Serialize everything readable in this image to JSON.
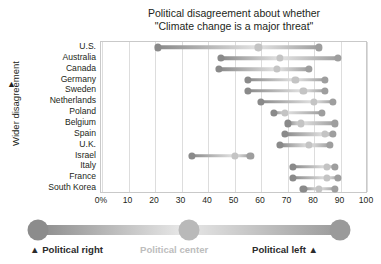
{
  "chart_data": {
    "type": "scatter",
    "title": "Political disagreement about whether \"Climate change is a major threat\"",
    "title_lines": [
      "Political disagreement about whether",
      "\"Climate change is a major threat\""
    ],
    "xlabel": "",
    "ylabel": "Wider disagreement",
    "ylabel_arrow": "▲",
    "xlim": [
      0,
      100
    ],
    "xticks": [
      0,
      10,
      20,
      30,
      40,
      50,
      60,
      70,
      80,
      90,
      100
    ],
    "xtick_labels": [
      "0%",
      "10",
      "20",
      "30",
      "40",
      "50",
      "60",
      "70",
      "80",
      "90",
      "100"
    ],
    "grid": true,
    "legend_position": "bottom",
    "series": [
      {
        "name": "Political right",
        "color": "#8c8c8c"
      },
      {
        "name": "Political center",
        "color": "#c2c2c2"
      },
      {
        "name": "Political left",
        "color": "#9a9a9a"
      }
    ],
    "categories": [
      "U.S.",
      "Australia",
      "Canada",
      "Germany",
      "Sweden",
      "Netherlands",
      "Poland",
      "Belgium",
      "Spain",
      "U.K.",
      "Israel",
      "Italy",
      "France",
      "South Korea"
    ],
    "rows": [
      {
        "country": "U.S.",
        "right": 21,
        "center": 59,
        "left": 82
      },
      {
        "country": "Australia",
        "right": 45,
        "center": 67,
        "left": 89
      },
      {
        "country": "Canada",
        "right": 44,
        "center": 66,
        "left": 78
      },
      {
        "country": "Germany",
        "right": 55,
        "center": 73,
        "left": 84
      },
      {
        "country": "Sweden",
        "right": 55,
        "center": 76,
        "left": 84
      },
      {
        "country": "Netherlands",
        "right": 60,
        "center": 80,
        "left": 87
      },
      {
        "country": "Poland",
        "right": 65,
        "center": 69,
        "left": 83
      },
      {
        "country": "Belgium",
        "right": 70,
        "center": 75,
        "left": 88
      },
      {
        "country": "Spain",
        "right": 69,
        "center": 84,
        "left": 87
      },
      {
        "country": "U.K.",
        "right": 67,
        "center": 78,
        "left": 86
      },
      {
        "country": "Israel",
        "right": 34,
        "center": 50,
        "left": 56
      },
      {
        "country": "Italy",
        "right": 72,
        "center": 85,
        "left": 88
      },
      {
        "country": "France",
        "right": 72,
        "center": 85,
        "left": 89
      },
      {
        "country": "South Korea",
        "right": 76,
        "center": 82,
        "left": 88
      }
    ]
  },
  "legend": {
    "left_label": "Political right",
    "center_label": "Political center",
    "right_label": "Political left",
    "left_arrow": "▲",
    "right_arrow": "▲",
    "left_color": "#8c8c8c",
    "center_color": "#b9b9b9",
    "right_color": "#9a9a9a",
    "center_text_color": "#bdbdbd"
  },
  "colors": {
    "dot_right": "#8a8a8a",
    "dot_center": "#c4c4c4",
    "dot_left": "#9e9e9e",
    "connector_a": "#8a8a8a",
    "connector_b": "#e3e3e3",
    "grid": "#dddddd",
    "frame": "#c9c9c9",
    "text": "#231f20"
  }
}
